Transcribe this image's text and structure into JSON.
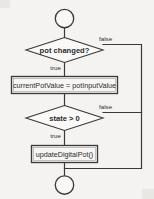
{
  "diagram": {
    "type": "flowchart",
    "background_color": "#f4f3f1",
    "line_color": "#3a3a3a",
    "nodes": {
      "start_terminator": {
        "shape": "circle",
        "label": ""
      },
      "decision_pot": {
        "shape": "diamond",
        "label": "pot changed?"
      },
      "process_assign": {
        "shape": "rectangle",
        "label": "currentPotValue = potInputValue"
      },
      "decision_state": {
        "shape": "diamond",
        "label": "state > 0"
      },
      "process_update": {
        "shape": "rectangle",
        "label": "updateDigitalPot()"
      },
      "end_terminator": {
        "shape": "circle",
        "label": ""
      }
    },
    "edges": {
      "pot_true": "true",
      "pot_false": "false",
      "state_true": "true",
      "state_false": "false"
    }
  }
}
